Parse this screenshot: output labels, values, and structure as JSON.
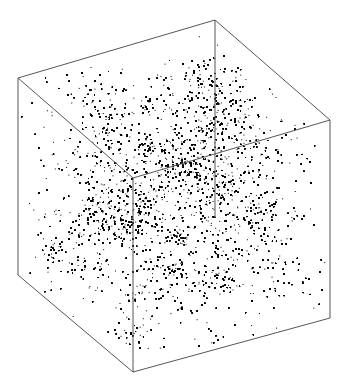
{
  "figure": {
    "background": "#ffffff",
    "point_color": "#000000",
    "edge_color": "#555555",
    "cube_vertices": {
      "back_top": [
        215,
        20
      ],
      "left_top": [
        18,
        78
      ],
      "right_top": [
        330,
        120
      ],
      "front_top": [
        133,
        178
      ],
      "back_bottom": [
        215,
        218
      ],
      "left_bottom": [
        18,
        275
      ],
      "right_bottom": [
        330,
        318
      ],
      "front_bottom": [
        133,
        372
      ]
    },
    "point_count": 42000
  }
}
